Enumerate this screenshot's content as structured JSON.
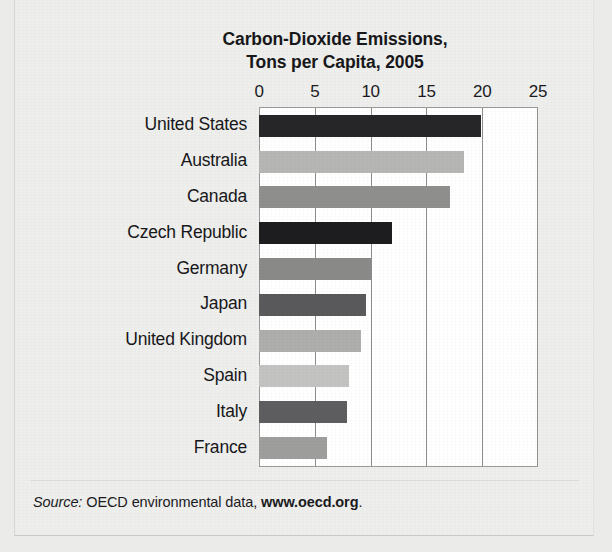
{
  "figure": {
    "top_cut_text": "",
    "title_line1": "Carbon-Dioxide Emissions,",
    "title_line2": "Tons per Capita, 2005",
    "source_prefix": "Source:",
    "source_body": " OECD environmental data, ",
    "source_url": "www.oecd.org",
    "source_suffix": "."
  },
  "chart_data": {
    "type": "bar",
    "orientation": "horizontal",
    "title": "Carbon-Dioxide Emissions, Tons per Capita, 2005",
    "xlabel": "",
    "ylabel": "",
    "xlim": [
      0,
      25
    ],
    "xticks": [
      0,
      5,
      10,
      15,
      20,
      25
    ],
    "xtick_labels": [
      "0",
      "5",
      "10",
      "15",
      "20",
      "25"
    ],
    "axis_position": "top",
    "grid": true,
    "legend": "none",
    "units": "Tons per Capita",
    "year": "2005",
    "categories": [
      "United States",
      "Australia",
      "Canada",
      "Czech Republic",
      "Germany",
      "Japan",
      "United Kingdom",
      "Spain",
      "Italy",
      "France"
    ],
    "values": [
      19.9,
      18.4,
      17.1,
      11.9,
      10.0,
      9.6,
      9.1,
      8.1,
      7.9,
      6.1
    ],
    "bar_colors": [
      "#262628",
      "#b6b6b4",
      "#8f8f8d",
      "#1d1d1f",
      "#8a8a88",
      "#5a5a5c",
      "#aeaeac",
      "#c3c3c1",
      "#5e5e60",
      "#9e9e9c"
    ],
    "bars": [
      {
        "label": "United States",
        "value": 19.9,
        "color": "#262628"
      },
      {
        "label": "Australia",
        "value": 18.4,
        "color": "#b6b6b4"
      },
      {
        "label": "Canada",
        "value": 17.1,
        "color": "#8f8f8d"
      },
      {
        "label": "Czech Republic",
        "value": 11.9,
        "color": "#1d1d1f"
      },
      {
        "label": "Germany",
        "value": 10.0,
        "color": "#8a8a88"
      },
      {
        "label": "Japan",
        "value": 9.6,
        "color": "#5a5a5c"
      },
      {
        "label": "United Kingdom",
        "value": 9.1,
        "color": "#aeaeac"
      },
      {
        "label": "Spain",
        "value": 8.1,
        "color": "#c3c3c1"
      },
      {
        "label": "Italy",
        "value": 7.9,
        "color": "#5e5e60"
      },
      {
        "label": "France",
        "value": 6.1,
        "color": "#9e9e9c"
      }
    ]
  },
  "colors": {
    "page_background": "#ebebe9",
    "plate_background": "#eeeeec",
    "plot_background": "#ffffff",
    "gridline": "#8e8e8c",
    "text": "#17171a"
  }
}
